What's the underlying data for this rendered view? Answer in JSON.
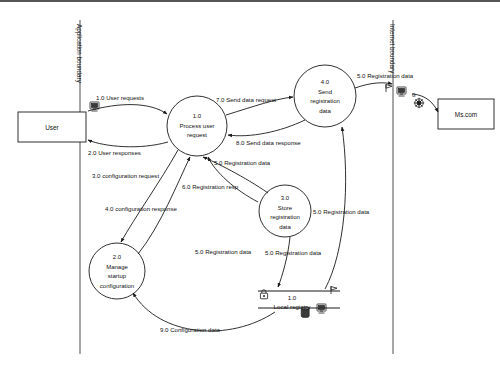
{
  "diagram": {
    "boundaries": [
      {
        "id": "application-boundary",
        "label": "Application boundary",
        "x": 80,
        "y1": 18,
        "y2": 352
      },
      {
        "id": "internet-boundary",
        "label": "Internet boundary",
        "x": 393,
        "y1": 18,
        "y2": 352
      }
    ],
    "entities": [
      {
        "id": "user",
        "label": "User",
        "x": 18,
        "y": 110,
        "w": 68,
        "h": 30
      },
      {
        "id": "ms-com",
        "label": "Ms.com",
        "x": 438,
        "y": 97,
        "w": 56,
        "h": 30
      }
    ],
    "processes": [
      {
        "id": "process-user-request",
        "number": "1.0",
        "lines": [
          "Process user",
          "request"
        ],
        "cx": 197,
        "cy": 124,
        "r": 30
      },
      {
        "id": "manage-startup-configuration",
        "number": "2.0",
        "lines": [
          "Manage",
          "startup",
          "configuration"
        ],
        "cx": 117,
        "cy": 269,
        "r": 28
      },
      {
        "id": "store-registration-data",
        "number": "3.0",
        "lines": [
          "Store",
          "registration",
          "data"
        ],
        "cx": 285,
        "cy": 209,
        "r": 26
      },
      {
        "id": "send-registration-data",
        "number": "4.0",
        "lines": [
          "Send",
          "registration",
          "data"
        ],
        "cx": 325,
        "cy": 94,
        "r": 31
      }
    ],
    "datastores": [
      {
        "id": "local-registry",
        "number": "1.0",
        "label": "Local registry",
        "x1": 258,
        "x2": 340,
        "y_top": 287,
        "y_bottom": 305
      }
    ],
    "flows": [
      {
        "id": "flow-1-user-requests",
        "label": "1.0 User requests",
        "lx": 96,
        "ly": 98
      },
      {
        "id": "flow-2-user-responses",
        "label": "2.0 User responses",
        "lx": 88,
        "ly": 153
      },
      {
        "id": "flow-7-send-data-request",
        "label": "7.0 Send data request",
        "lx": 216,
        "ly": 100
      },
      {
        "id": "flow-8-send-data-response",
        "label": "8.0 Send data response",
        "lx": 236,
        "ly": 143
      },
      {
        "id": "flow-5-registration-data-top",
        "label": "5.0 Registration data",
        "lx": 357,
        "ly": 76
      },
      {
        "id": "flow-5-registration-data-proc",
        "label": "5.0 Registration data",
        "lx": 214,
        "ly": 163
      },
      {
        "id": "flow-3-configuration-request",
        "label": "3.0 configuration request",
        "lx": 92,
        "ly": 176
      },
      {
        "id": "flow-6-registration-resp",
        "label": "6.0 Registration resp",
        "lx": 182,
        "ly": 187
      },
      {
        "id": "flow-4-configuration-response",
        "label": "4.0 configuration response",
        "lx": 105,
        "ly": 209
      },
      {
        "id": "flow-5-registration-data-store",
        "label": "5.0 Registration data",
        "lx": 220,
        "ly": 252
      },
      {
        "id": "flow-5-registration-data-right",
        "label": "5.0 Registration data",
        "lx": 313,
        "ly": 212
      },
      {
        "id": "flow-5-registration-data-lower",
        "label": "5.0 Registration data",
        "lx": 265,
        "ly": 250
      },
      {
        "id": "flow-9-configuration-data",
        "label": "9.0 Configuration data",
        "lx": 160,
        "ly": 330
      }
    ],
    "icons": [
      {
        "id": "monitor-icon-user",
        "name": "monitor-icon",
        "x": 92,
        "y": 101
      },
      {
        "id": "flag-icon-internet",
        "name": "flag-icon",
        "x": 385,
        "y": 83
      },
      {
        "id": "monitor-icon-internet",
        "name": "monitor-icon",
        "x": 398,
        "y": 86
      },
      {
        "id": "globe-icon-internet",
        "name": "globe-icon",
        "x": 419,
        "y": 100
      },
      {
        "id": "g-label-internet",
        "name": "g-letter-label",
        "label": "G",
        "x": 414,
        "y": 93
      },
      {
        "id": "lock-icon-store",
        "name": "lock-icon",
        "x": 261,
        "y": 288
      },
      {
        "id": "flag-icon-store",
        "name": "flag-icon",
        "x": 331,
        "y": 286
      },
      {
        "id": "database-icon-store",
        "name": "database-icon",
        "x": 304,
        "y": 306
      },
      {
        "id": "monitor-icon-store",
        "name": "monitor-icon",
        "x": 320,
        "y": 304
      }
    ]
  }
}
